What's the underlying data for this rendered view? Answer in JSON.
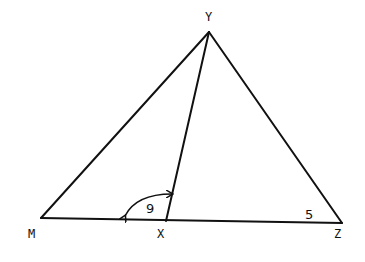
{
  "diagram": {
    "type": "triangle",
    "line_color": "#111111",
    "background": "#ffffff",
    "vertices": {
      "Y": {
        "label": "Y",
        "x": 209,
        "y": 32,
        "label_x": 209,
        "label_y": 20
      },
      "M": {
        "label": "M",
        "x": 41,
        "y": 218,
        "label_x": 32,
        "label_y": 238
      },
      "X": {
        "label": "X",
        "x": 166,
        "y": 221,
        "label_x": 161,
        "label_y": 238
      },
      "Z": {
        "label": "Z",
        "x": 342,
        "y": 223,
        "label_x": 338,
        "label_y": 238
      }
    },
    "segments": [
      {
        "name": "MY",
        "from": "M",
        "to": "Y"
      },
      {
        "name": "YZ",
        "from": "Y",
        "to": "Z"
      },
      {
        "name": "MZ",
        "from": "M",
        "to": "Z"
      },
      {
        "name": "XY",
        "from": "X",
        "to": "Y"
      }
    ],
    "angles": [
      {
        "name": "angle-MXY",
        "label": "9",
        "at": "X",
        "arc": "double-arrow",
        "label_x": 146,
        "label_y": 213
      },
      {
        "name": "angle-Z",
        "label": "5",
        "at": "Z",
        "label_x": 305,
        "label_y": 219
      }
    ]
  }
}
